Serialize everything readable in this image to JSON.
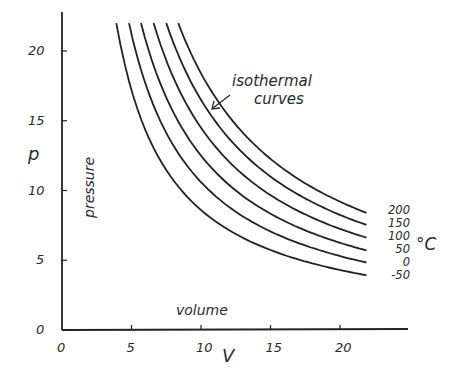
{
  "chart_data": {
    "type": "line",
    "title": "",
    "xlabel": "V",
    "ylabel": "p",
    "x_axis_word": "volume",
    "y_axis_word": "pressure",
    "annotation": [
      "isothermal",
      "curves"
    ],
    "unit_label": "°C",
    "xlim": [
      0,
      25
    ],
    "ylim": [
      0,
      23
    ],
    "x_ticks": [
      "0",
      "5",
      "10",
      "15",
      "20"
    ],
    "y_ticks": [
      "0",
      "5",
      "10",
      "15",
      "20"
    ],
    "grid": false,
    "legend_position": "right (inline labels at curve ends)",
    "series": [
      {
        "name": "200",
        "k": 184,
        "x": [
          8.4,
          10,
          12,
          14,
          16,
          18,
          20,
          21.9
        ],
        "values": [
          21.9,
          18.4,
          15.3,
          13.1,
          11.5,
          10.2,
          9.2,
          8.4
        ]
      },
      {
        "name": "150",
        "k": 165,
        "x": [
          7.5,
          10,
          12,
          14,
          16,
          18,
          20,
          21.9
        ],
        "values": [
          22.0,
          16.5,
          13.8,
          11.8,
          10.3,
          9.2,
          8.3,
          7.5
        ]
      },
      {
        "name": "100",
        "k": 145,
        "x": [
          6.6,
          10,
          12,
          14,
          16,
          18,
          20,
          21.9
        ],
        "values": [
          22.0,
          14.5,
          12.1,
          10.4,
          9.1,
          8.1,
          7.3,
          6.6
        ]
      },
      {
        "name": "50",
        "k": 125,
        "x": [
          5.7,
          10,
          12,
          14,
          16,
          18,
          20,
          21.9
        ],
        "values": [
          21.9,
          12.5,
          10.4,
          8.9,
          7.8,
          6.9,
          6.3,
          5.7
        ]
      },
      {
        "name": "0",
        "k": 106,
        "x": [
          4.8,
          10,
          12,
          14,
          16,
          18,
          20,
          21.9
        ],
        "values": [
          22.0,
          10.6,
          8.8,
          7.6,
          6.6,
          5.9,
          5.3,
          4.8
        ]
      },
      {
        "name": "-50",
        "k": 86,
        "x": [
          3.9,
          10,
          12,
          14,
          16,
          18,
          20,
          21.9
        ],
        "values": [
          22.0,
          8.6,
          7.2,
          6.1,
          5.4,
          4.8,
          4.3,
          3.9
        ]
      }
    ]
  }
}
